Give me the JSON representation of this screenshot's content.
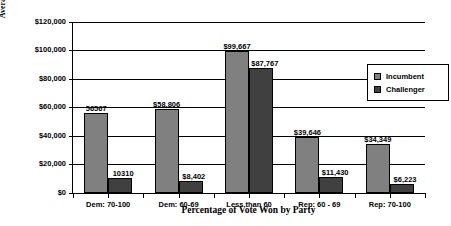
{
  "chart_data": {
    "type": "bar",
    "title": "",
    "xlabel": "Percentage of Vote Won by Party",
    "ylabel": "Average Expenditure",
    "ylim": [
      0,
      120000
    ],
    "ytick_values": [
      0,
      20000,
      40000,
      60000,
      80000,
      100000,
      120000
    ],
    "ytick_labels": [
      "$0",
      "$20,000",
      "$40,000",
      "$60,000",
      "$80,000",
      "$100,000",
      "$120,000"
    ],
    "grid": "horizontal",
    "legend_position": "inside-top-right",
    "categories": [
      "Dem: 70-100",
      "Dem: 60-69",
      "Less than 60",
      "Rep: 60 - 69",
      "Rep: 70-100"
    ],
    "series": [
      {
        "name": "Incumbent",
        "color": "#808080",
        "values": [
          56567,
          58806,
          99667,
          39646,
          34349
        ],
        "data_labels": [
          "56567",
          "$58,806",
          "$99,667",
          "$39,646",
          "$34,349"
        ]
      },
      {
        "name": "Challenger",
        "color": "#404040",
        "values": [
          10310,
          8402,
          87767,
          11430,
          6223
        ],
        "data_labels": [
          "10310",
          "$8,402",
          "$87,767",
          "$11,430",
          "$6,223"
        ]
      }
    ]
  },
  "legend": {
    "items": [
      {
        "label": "Incumbent",
        "color": "#808080"
      },
      {
        "label": "Challenger",
        "color": "#404040"
      }
    ]
  }
}
